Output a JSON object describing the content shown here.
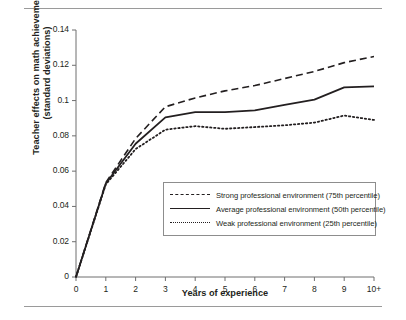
{
  "chart_data": {
    "type": "line",
    "title": "",
    "xlabel": "Years of experience",
    "ylabel": "Teacher effects on math achievement (standard deviations)",
    "x": [
      0,
      1,
      2,
      3,
      4,
      5,
      6,
      7,
      8,
      9,
      10
    ],
    "xtick_labels": [
      "0",
      "1",
      "2",
      "3",
      "4",
      "5",
      "6",
      "7",
      "8",
      "9",
      "10+"
    ],
    "ytick_labels": [
      "0",
      "0.02",
      "0.04",
      "0.06",
      "0.08",
      "0.1",
      "0.12",
      "0.14"
    ],
    "ytick_values": [
      0,
      0.02,
      0.04,
      0.06,
      0.08,
      0.1,
      0.12,
      0.14
    ],
    "ylim": [
      0,
      0.14
    ],
    "xlim": [
      0,
      10
    ],
    "grid": false,
    "legend_position": "center-right-inside",
    "series": [
      {
        "name": "Strong professional environment (75th percentile)",
        "style": "dashed",
        "color": "#231f20",
        "values": [
          0,
          0.0535,
          0.0785,
          0.0965,
          0.1015,
          0.1055,
          0.1085,
          0.1125,
          0.1165,
          0.1215,
          0.125
        ]
      },
      {
        "name": "Average professional environment (50th percentile)",
        "style": "solid",
        "color": "#231f20",
        "values": [
          0,
          0.053,
          0.0755,
          0.0905,
          0.0935,
          0.0935,
          0.0945,
          0.0975,
          0.1005,
          0.1075,
          0.108
        ]
      },
      {
        "name": "Weak professional environment (25th percentile)",
        "style": "dotted",
        "color": "#231f20",
        "values": [
          0,
          0.0525,
          0.0725,
          0.0835,
          0.0855,
          0.084,
          0.085,
          0.086,
          0.0875,
          0.0915,
          0.089
        ]
      }
    ]
  },
  "legend": {
    "items": [
      {
        "label": "Strong professional environment (75th percentile)",
        "style": "dashed"
      },
      {
        "label": "Average professional environment (50th percentile)",
        "style": "solid"
      },
      {
        "label": "Weak professional environment (25th percentile)",
        "style": "dotted"
      }
    ]
  },
  "axes": {
    "x_title": "Years of experience",
    "y_title_line1": "Teacher effects on math achievement",
    "y_title_line2": "(standard deviations)"
  }
}
